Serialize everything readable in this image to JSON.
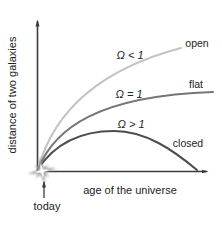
{
  "figure": {
    "x_axis_label": "age of the universe",
    "y_axis_label": "distance of two galaxies",
    "origin_label": "today",
    "curves": [
      {
        "name": "open",
        "equation_label": "Ω < 1",
        "end_label": "open",
        "color": "#c3c3c3"
      },
      {
        "name": "flat",
        "equation_label": "Ω = 1",
        "end_label": "flat",
        "color": "#767676"
      },
      {
        "name": "closed",
        "equation_label": "Ω > 1",
        "end_label": "closed",
        "color": "#4d4d4d"
      }
    ],
    "colors": {
      "axis": "#3c3c3c",
      "text": "#222222",
      "background": "#ffffff",
      "starburst": "#a3a3a3"
    }
  }
}
